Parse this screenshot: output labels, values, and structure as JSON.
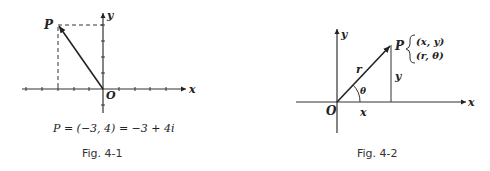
{
  "figure1": {
    "caption": "Fig. 4-1",
    "equation": "P = (−3, 4) = −3 + 4i",
    "labels": {
      "point": "P",
      "origin": "O",
      "x_axis": "x",
      "y_axis": "y"
    },
    "point": {
      "x": -3,
      "y": 4
    }
  },
  "figure2": {
    "caption": "Fig. 4-2",
    "labels": {
      "point": "P",
      "origin": "O",
      "x_axis": "x",
      "y_axis": "y",
      "radius": "r",
      "angle": "θ",
      "x_length": "x",
      "y_length": "y",
      "cartesian": "(x, y)",
      "polar": "(r, θ)"
    }
  }
}
